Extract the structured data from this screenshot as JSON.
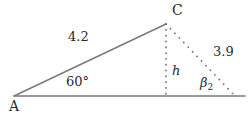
{
  "figure": {
    "background_color": "#ffffff",
    "line_color": "#7a7a7a",
    "dot_color": "#6e6e6e",
    "text_color": "#2b2b2b",
    "width": 248,
    "height": 115
  },
  "labels": {
    "vertex_a": "A",
    "vertex_c": "C",
    "side_ac_length": "4.2",
    "angle_at_a": "60°",
    "height_symbol": "h",
    "side_bc_length": "3.9",
    "angle_beta_2_base": "β",
    "angle_beta_2_sub": "2"
  },
  "geometry": {
    "points": {
      "A": [
        14,
        96
      ],
      "C": [
        166,
        24
      ],
      "foot": [
        166,
        96
      ],
      "B2": [
        235,
        96
      ],
      "baseline_end": [
        245,
        96
      ]
    },
    "segments": [
      {
        "name": "baseline-ray",
        "from": [
          14,
          96
        ],
        "to": [
          245,
          96
        ],
        "style": "solid"
      },
      {
        "name": "side-ac",
        "from": [
          14,
          96
        ],
        "to": [
          166,
          24
        ],
        "style": "solid"
      },
      {
        "name": "height-h",
        "from": [
          166,
          24
        ],
        "to": [
          166,
          96
        ],
        "style": "dotted"
      },
      {
        "name": "side-cb2",
        "from": [
          166,
          24
        ],
        "to": [
          235,
          96
        ],
        "style": "dotted"
      }
    ]
  }
}
